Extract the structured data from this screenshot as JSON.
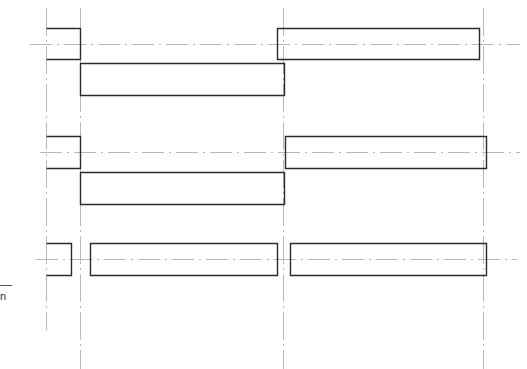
{
  "drawing": {
    "background": "#ffffff",
    "stroke_color": "#2b2b2b",
    "centerline_color": "#b8b8b8",
    "edge_label": "n",
    "edge_rule": {
      "x1": 0,
      "x2": 12,
      "y": 285
    },
    "vertical_centerlines": [
      {
        "x": 46,
        "y1": 8,
        "y2": 330
      },
      {
        "x": 80,
        "y1": 8,
        "y2": 369
      },
      {
        "x": 283,
        "y1": 8,
        "y2": 369
      },
      {
        "x": 483,
        "y1": 8,
        "y2": 369
      }
    ],
    "horizontal_centerlines": [
      {
        "y": 44,
        "x1": 30,
        "x2": 520
      },
      {
        "y": 152,
        "x1": 40,
        "x2": 520
      },
      {
        "y": 259,
        "x1": 36,
        "x2": 517
      }
    ],
    "blocks": [
      {
        "row": 1,
        "x": 46,
        "y": 28,
        "w": 34,
        "h": 31,
        "open_left": true
      },
      {
        "row": 1,
        "x": 80,
        "y": 63,
        "w": 204,
        "h": 32,
        "open_left": false
      },
      {
        "row": 1,
        "x": 277,
        "y": 28,
        "w": 202,
        "h": 31,
        "open_left": false
      },
      {
        "row": 2,
        "x": 46,
        "y": 136,
        "w": 34,
        "h": 32,
        "open_left": true
      },
      {
        "row": 2,
        "x": 80,
        "y": 172,
        "w": 204,
        "h": 32,
        "open_left": false
      },
      {
        "row": 2,
        "x": 285,
        "y": 136,
        "w": 201,
        "h": 32,
        "open_left": false
      },
      {
        "row": 3,
        "x": 46,
        "y": 243,
        "w": 25,
        "h": 32,
        "open_left": true
      },
      {
        "row": 3,
        "x": 90,
        "y": 243,
        "w": 187,
        "h": 32,
        "open_left": false
      },
      {
        "row": 3,
        "x": 290,
        "y": 243,
        "w": 196,
        "h": 32,
        "open_left": false
      }
    ]
  }
}
